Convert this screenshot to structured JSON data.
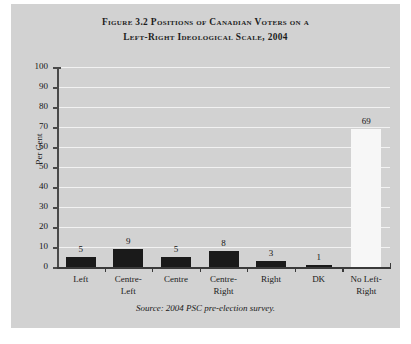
{
  "figure": {
    "title_line1": "Figure 3.2 Positions of Canadian Voters on a",
    "title_line2": "Left-Right Ideological Scale, 2004",
    "source": "Source: 2004 PSC pre-election survey.",
    "background_color": "#d2d2d2",
    "gridline_color": "#f2f2f2",
    "bar_color_dark": "#1a1a1a",
    "bar_color_light": "#f7f7f7"
  },
  "chart_data": {
    "type": "bar",
    "title": "Figure 3.2 Positions of Canadian Voters on a Left-Right Ideological Scale, 2004",
    "xlabel": "",
    "ylabel": "Per Cent",
    "categories": [
      "Left",
      "Centre-Left",
      "Centre",
      "Centre-Right",
      "Right",
      "DK",
      "No Left-Right"
    ],
    "category_lines": [
      [
        "Left"
      ],
      [
        "Centre-",
        "Left"
      ],
      [
        "Centre"
      ],
      [
        "Centre-",
        "Right"
      ],
      [
        "Right"
      ],
      [
        "DK"
      ],
      [
        "No Left-",
        "Right"
      ]
    ],
    "values": [
      5,
      9,
      5,
      8,
      3,
      1,
      69
    ],
    "bar_styles": [
      "dark",
      "dark",
      "dark",
      "dark",
      "dark",
      "dark",
      "light"
    ],
    "ylim": [
      0,
      100
    ],
    "yticks": [
      0,
      10,
      20,
      30,
      40,
      50,
      60,
      70,
      80,
      90,
      100
    ],
    "ytick_labels": [
      "0",
      "10",
      "20",
      "30",
      "40",
      "50",
      "60",
      "70",
      "80",
      "90",
      "100"
    ],
    "grid": true,
    "legend": false,
    "data_labels": [
      "5",
      "9",
      "5",
      "8",
      "3",
      "1",
      "69"
    ],
    "source_note": "Source: 2004 PSC pre-election survey."
  }
}
